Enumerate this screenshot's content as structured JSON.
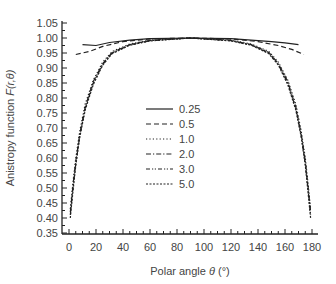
{
  "chart_data": {
    "type": "line",
    "title": "",
    "xlabel": "Polar angle θ (°)",
    "ylabel": "Anistropy function F(r,θ)",
    "xlim": [
      0,
      180
    ],
    "ylim": [
      0.35,
      1.05
    ],
    "x_ticks": [
      0,
      20,
      40,
      60,
      80,
      100,
      120,
      140,
      160,
      180
    ],
    "y_ticks": [
      0.35,
      0.4,
      0.45,
      0.5,
      0.55,
      0.6,
      0.65,
      0.7,
      0.75,
      0.8,
      0.85,
      0.9,
      0.95,
      1.0,
      1.05
    ],
    "grid": false,
    "legend_position": "center-left inside",
    "series": [
      {
        "name": "0.25",
        "dash": "solid",
        "x": [
          10,
          20,
          30,
          45,
          60,
          90,
          120,
          135,
          150,
          160,
          170
        ],
        "y": [
          0.978,
          0.975,
          0.985,
          0.993,
          0.998,
          1.0,
          0.998,
          0.993,
          0.988,
          0.984,
          0.978
        ]
      },
      {
        "name": "0.5",
        "dash": "dash",
        "x": [
          5,
          15,
          25,
          40,
          60,
          90,
          120,
          140,
          155,
          165,
          174
        ],
        "y": [
          0.945,
          0.955,
          0.972,
          0.988,
          0.997,
          1.0,
          0.997,
          0.988,
          0.975,
          0.962,
          0.945
        ]
      },
      {
        "name": "1.0",
        "dash": "dot",
        "x": [
          1,
          3,
          5,
          8,
          12,
          18,
          25,
          32,
          45,
          60,
          90,
          120,
          135,
          148,
          155,
          162,
          168,
          172,
          175,
          177,
          179
        ],
        "y": [
          0.43,
          0.52,
          0.6,
          0.69,
          0.78,
          0.86,
          0.92,
          0.955,
          0.98,
          0.993,
          1.0,
          0.993,
          0.98,
          0.955,
          0.92,
          0.86,
          0.78,
          0.69,
          0.6,
          0.52,
          0.43
        ]
      },
      {
        "name": "2.0",
        "dash": "dashdot",
        "x": [
          1,
          3,
          5,
          8,
          12,
          18,
          25,
          32,
          45,
          60,
          90,
          120,
          135,
          148,
          155,
          162,
          168,
          172,
          175,
          177,
          179
        ],
        "y": [
          0.42,
          0.51,
          0.59,
          0.68,
          0.77,
          0.855,
          0.915,
          0.952,
          0.978,
          0.992,
          1.0,
          0.992,
          0.978,
          0.952,
          0.915,
          0.855,
          0.77,
          0.68,
          0.59,
          0.51,
          0.42
        ]
      },
      {
        "name": "3.0",
        "dash": "dashdotdot",
        "x": [
          1,
          3,
          5,
          8,
          12,
          18,
          25,
          32,
          45,
          60,
          90,
          120,
          135,
          148,
          155,
          162,
          168,
          172,
          175,
          177,
          179
        ],
        "y": [
          0.41,
          0.5,
          0.58,
          0.675,
          0.765,
          0.85,
          0.912,
          0.95,
          0.977,
          0.991,
          1.0,
          0.991,
          0.977,
          0.95,
          0.912,
          0.85,
          0.765,
          0.675,
          0.58,
          0.5,
          0.41
        ]
      },
      {
        "name": "5.0",
        "dash": "shortdash",
        "x": [
          1,
          3,
          5,
          8,
          12,
          18,
          25,
          32,
          45,
          60,
          90,
          120,
          135,
          148,
          155,
          162,
          168,
          172,
          175,
          177,
          179
        ],
        "y": [
          0.4,
          0.49,
          0.575,
          0.67,
          0.76,
          0.845,
          0.91,
          0.948,
          0.976,
          0.99,
          1.0,
          0.99,
          0.976,
          0.948,
          0.91,
          0.845,
          0.76,
          0.67,
          0.575,
          0.49,
          0.4
        ]
      }
    ]
  },
  "axes": {
    "xlabel_prefix": "Polar angle ",
    "xlabel_symbol": "θ",
    "xlabel_suffix": " (°)",
    "ylabel_prefix": "Anistropy function ",
    "ylabel_symbol": "F(r,θ)"
  },
  "colors": {
    "line": "#222222",
    "axis": "#222222",
    "text": "#444444"
  }
}
